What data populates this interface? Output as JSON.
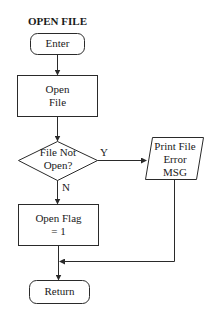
{
  "title": "OPEN FILE",
  "nodes": {
    "enter": {
      "shape": "terminal",
      "label": "Enter"
    },
    "open_file": {
      "shape": "process",
      "line1": "Open",
      "line2": "File"
    },
    "decision": {
      "shape": "decision",
      "line1": "File Not",
      "line2": "Open?"
    },
    "print_error": {
      "shape": "io",
      "line1": "Print File",
      "line2": "Error",
      "line3": "MSG"
    },
    "open_flag": {
      "shape": "process",
      "line1": "Open Flag",
      "line2": "= 1"
    },
    "return": {
      "shape": "terminal",
      "label": "Return"
    }
  },
  "edges": {
    "yes_label": "Y",
    "no_label": "N"
  },
  "colors": {
    "stroke": "#2a2a2a",
    "background": "#ffffff",
    "text": "#1a1a1a"
  }
}
